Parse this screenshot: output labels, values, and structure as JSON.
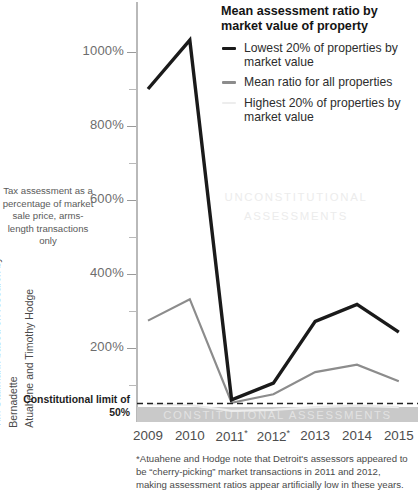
{
  "legend": {
    "title": "Mean assessment ratio by market value of property",
    "items": [
      {
        "label": "Lowest 20% of properties by market value",
        "color": "#1a1a1a",
        "thickness": "3.4px"
      },
      {
        "label": "Mean ratio for all properties",
        "color": "#8c8c8c",
        "thickness": "2.2px"
      },
      {
        "label": "Highest 20% of properties by market value",
        "color": "#ededed",
        "thickness": "2.2px"
      }
    ]
  },
  "axis_description": "Tax assessment as a percentage of market sale price, arms-length transactions only",
  "credit": "Tim Stallmann based on research by Bernadette\nAtuahene and Timothy Hodge",
  "footnote": "*Atuahene and Hodge note that Detroit's assessors appeared to be “cherry-picking” market transactions in 2011 and 2012, making assessment ratios appear artificially low in these years.",
  "annotations": {
    "unconstitutional": "UNCONSTITUTIONAL ASSESSMENTS",
    "constitutional_band": "CONSTITUTIONAL ASSESSMENTS",
    "limit_label": "Constitutional limit of 50%"
  },
  "chart_data": {
    "type": "line",
    "title": "Mean assessment ratio by market value of property",
    "xlabel": "",
    "ylabel": "Tax assessment as a percentage of market sale price, arms-length transactions only",
    "x": [
      2009,
      2010,
      2011,
      2012,
      2013,
      2014,
      2015
    ],
    "tick_labels": [
      "2009",
      "2010",
      "2011*",
      "2012*",
      "2013",
      "2014",
      "2015"
    ],
    "ylim": [
      0,
      1055
    ],
    "yticks": [
      200,
      400,
      600,
      800,
      1000
    ],
    "ytick_labels": [
      "200%",
      "400%",
      "600%",
      "800%",
      "1000%"
    ],
    "yminor_ticks": [
      100,
      300,
      500,
      700,
      900
    ],
    "grid": false,
    "legend_position": "top-right",
    "reference_line": {
      "value": 50,
      "label": "Constitutional limit of 50%",
      "style": "dashed"
    },
    "shaded_region": {
      "from": 0,
      "to": 50,
      "label": "CONSTITUTIONAL ASSESSMENTS"
    },
    "series": [
      {
        "name": "Lowest 20% of properties by market value",
        "color": "#1a1a1a",
        "values": [
          900,
          1032,
          60,
          105,
          272,
          318,
          243
        ]
      },
      {
        "name": "Mean ratio for all properties",
        "color": "#8c8c8c",
        "values": [
          274,
          332,
          52,
          75,
          135,
          155,
          110
        ]
      },
      {
        "name": "Highest 20% of properties by market value",
        "color": "#ededed",
        "values": [
          48,
          46,
          30,
          33,
          40,
          44,
          40
        ]
      }
    ]
  }
}
